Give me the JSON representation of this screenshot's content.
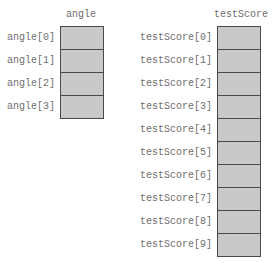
{
  "arrays": [
    {
      "name": "angle",
      "elements": [
        "angle[0]",
        "angle[1]",
        "angle[2]",
        "angle[3]"
      ]
    },
    {
      "name": "testScore",
      "elements": [
        "testScore[0]",
        "testScore[1]",
        "testScore[2]",
        "testScore[3]",
        "testScore[4]",
        "testScore[5]",
        "testScore[6]",
        "testScore[7]",
        "testScore[8]",
        "testScore[9]"
      ]
    }
  ],
  "colors": {
    "cell_fill": "#c9c9c9",
    "cell_border": "#4a4a4a",
    "text": "#6e6e6e"
  }
}
